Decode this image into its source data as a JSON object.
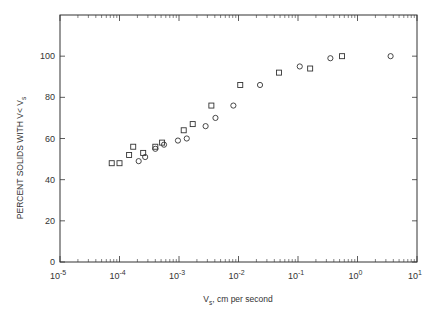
{
  "chart_data": {
    "type": "scatter",
    "title": "",
    "xlabel": "V_s, cm per second",
    "xlabel_main": "V",
    "xlabel_sub": "s",
    "xlabel_rest": ", cm per second",
    "ylabel": "PERCENT SOLIDS WITH V< V_s",
    "ylabel_main": "PERCENT SOLIDS WITH V< V",
    "ylabel_sub": "s",
    "xscale": "log",
    "xlim": [
      1e-05,
      10
    ],
    "ylim": [
      0,
      120
    ],
    "grid": false,
    "legend": null,
    "x_ticks": [
      {
        "exp": -5,
        "label_base": "10",
        "label_exp": "-5"
      },
      {
        "exp": -4,
        "label_base": "10",
        "label_exp": "-4"
      },
      {
        "exp": -3,
        "label_base": "10",
        "label_exp": "-3"
      },
      {
        "exp": -2,
        "label_base": "10",
        "label_exp": "-2"
      },
      {
        "exp": -1,
        "label_base": "10",
        "label_exp": "-1"
      },
      {
        "exp": 0,
        "label_base": "10",
        "label_exp": "0"
      },
      {
        "exp": 1,
        "label_base": "10",
        "label_exp": "1"
      }
    ],
    "y_ticks": [
      0,
      20,
      40,
      60,
      80,
      100
    ],
    "series": [
      {
        "name": "squares",
        "marker": "square",
        "points": [
          {
            "x": 7.4e-05,
            "y": 48
          },
          {
            "x": 0.0001,
            "y": 48
          },
          {
            "x": 0.000145,
            "y": 52
          },
          {
            "x": 0.00017,
            "y": 56
          },
          {
            "x": 0.00025,
            "y": 53
          },
          {
            "x": 0.0004,
            "y": 56
          },
          {
            "x": 0.00052,
            "y": 58
          },
          {
            "x": 0.0012,
            "y": 64
          },
          {
            "x": 0.0017,
            "y": 67
          },
          {
            "x": 0.0035,
            "y": 76
          },
          {
            "x": 0.0107,
            "y": 86
          },
          {
            "x": 0.048,
            "y": 92
          },
          {
            "x": 0.16,
            "y": 94
          },
          {
            "x": 0.55,
            "y": 100
          }
        ]
      },
      {
        "name": "circles",
        "marker": "circle",
        "points": [
          {
            "x": 0.00021,
            "y": 49
          },
          {
            "x": 0.00027,
            "y": 51
          },
          {
            "x": 0.0004,
            "y": 55
          },
          {
            "x": 0.00056,
            "y": 57
          },
          {
            "x": 0.00096,
            "y": 59
          },
          {
            "x": 0.00135,
            "y": 60
          },
          {
            "x": 0.0028,
            "y": 66
          },
          {
            "x": 0.0041,
            "y": 70
          },
          {
            "x": 0.0082,
            "y": 76
          },
          {
            "x": 0.023,
            "y": 86
          },
          {
            "x": 0.107,
            "y": 95
          },
          {
            "x": 0.35,
            "y": 99
          },
          {
            "x": 3.6,
            "y": 100
          }
        ]
      }
    ]
  },
  "colors": {
    "axis": "#333333",
    "marker": "#333333",
    "background": "#ffffff"
  }
}
